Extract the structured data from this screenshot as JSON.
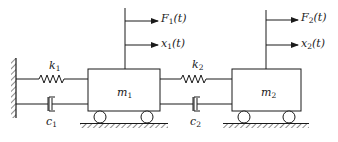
{
  "diagram": {
    "type": "two-degree-of-freedom mass-spring-damper system",
    "colors": {
      "ink": "#1a1a1a",
      "background": "#ffffff"
    },
    "masses": [
      {
        "id": "m1",
        "label": "m",
        "sub": "1"
      },
      {
        "id": "m2",
        "label": "m",
        "sub": "2"
      }
    ],
    "springs": [
      {
        "id": "k1",
        "label": "k",
        "sub": "1",
        "connects": [
          "wall",
          "m1"
        ]
      },
      {
        "id": "k2",
        "label": "k",
        "sub": "2",
        "connects": [
          "m1",
          "m2"
        ]
      }
    ],
    "dampers": [
      {
        "id": "c1",
        "label": "c",
        "sub": "1",
        "connects": [
          "wall",
          "m1"
        ]
      },
      {
        "id": "c2",
        "label": "c",
        "sub": "2",
        "connects": [
          "m1",
          "m2"
        ]
      }
    ],
    "forces": [
      {
        "id": "F1",
        "label": "F",
        "sub": "1",
        "arg": "(t)",
        "on": "m1"
      },
      {
        "id": "F2",
        "label": "F",
        "sub": "2",
        "arg": "(t)",
        "on": "m2"
      }
    ],
    "displacements": [
      {
        "id": "x1",
        "label": "x",
        "sub": "1",
        "arg": "(t)",
        "on": "m1"
      },
      {
        "id": "x2",
        "label": "x",
        "sub": "2",
        "arg": "(t)",
        "on": "m2"
      }
    ]
  }
}
